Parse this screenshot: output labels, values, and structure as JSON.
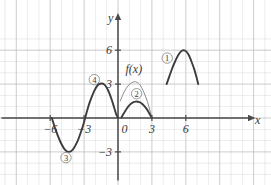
{
  "figure": {
    "kind": "math-graph",
    "width": 271,
    "height": 185,
    "background": "#ffffff"
  },
  "axes": {
    "x_axis_label": "x",
    "y_axis_label": "y",
    "x_ticks": [
      {
        "value": -6,
        "label": "−6"
      },
      {
        "value": -3,
        "label": "−3"
      },
      {
        "value": 0,
        "label": "0"
      },
      {
        "value": 3,
        "label": "3"
      },
      {
        "value": 6,
        "label": "6"
      }
    ],
    "y_ticks": [
      {
        "value": 6,
        "label": "6"
      },
      {
        "value": 3,
        "label": "3"
      },
      {
        "value": -3,
        "label": "−3"
      }
    ],
    "x_range": [
      -8.5,
      11
    ],
    "y_range": [
      -5,
      7
    ],
    "grid": true,
    "grid_color": "#cfcfcf",
    "grid_major_color": "#bdbdbd",
    "axis_color": "#4a4a4a"
  },
  "labels": {
    "function_label": "f(x)",
    "curve_1": "①",
    "curve_2": "②",
    "curve_3": "③",
    "curve_4": "④"
  },
  "colors": {
    "curve_dark": "#3d3d3d",
    "curve_light": "#8a8a8a",
    "text": "#3a3a3a"
  },
  "chart_data": {
    "type": "line",
    "title": "",
    "xlabel": "x",
    "ylabel": "y",
    "xlim": [
      -8.5,
      11
    ],
    "ylim": [
      -5,
      7
    ],
    "grid": true,
    "legend": "none",
    "series": [
      {
        "name": "③ / ④ sine-like wave (left, bold)",
        "style": "bold-dark",
        "annotation_above": "④",
        "annotation_below": "③",
        "points": [
          [
            -5.85,
            0.0
          ],
          [
            -5.5,
            -1.1
          ],
          [
            -5.1,
            -2.1
          ],
          [
            -4.7,
            -2.8
          ],
          [
            -4.35,
            -3.0
          ],
          [
            -4.0,
            -2.8
          ],
          [
            -3.6,
            -2.1
          ],
          [
            -3.2,
            -1.0
          ],
          [
            -3.0,
            -0.35
          ],
          [
            -2.8,
            0.4
          ],
          [
            -2.5,
            1.4
          ],
          [
            -2.1,
            2.4
          ],
          [
            -1.8,
            2.9
          ],
          [
            -1.5,
            3.05
          ],
          [
            -1.2,
            2.95
          ],
          [
            -0.9,
            2.5
          ],
          [
            -0.6,
            1.75
          ],
          [
            -0.35,
            0.95
          ],
          [
            -0.15,
            0.3
          ],
          [
            0.0,
            0.05
          ]
        ]
      },
      {
        "name": "f(x) parabola-like arch (thin gray)",
        "style": "thin-gray",
        "annotation": "f(x)",
        "points": [
          [
            0.2,
            1.5
          ],
          [
            0.4,
            2.0
          ],
          [
            0.6,
            2.4
          ],
          [
            0.85,
            2.8
          ],
          [
            1.1,
            3.05
          ],
          [
            1.4,
            3.2
          ],
          [
            1.7,
            3.15
          ],
          [
            2.0,
            2.85
          ],
          [
            2.3,
            2.25
          ],
          [
            2.6,
            1.45
          ],
          [
            2.85,
            0.6
          ],
          [
            3.0,
            0.0
          ]
        ]
      },
      {
        "name": "② flattened arch (bold dark)",
        "style": "bold-dark",
        "annotation": "②",
        "points": [
          [
            0.3,
            0.05
          ],
          [
            0.6,
            0.55
          ],
          [
            0.9,
            1.0
          ],
          [
            1.2,
            1.3
          ],
          [
            1.55,
            1.45
          ],
          [
            1.9,
            1.4
          ],
          [
            2.2,
            1.2
          ],
          [
            2.5,
            0.85
          ],
          [
            2.75,
            0.45
          ],
          [
            3.0,
            0.0
          ]
        ]
      },
      {
        "name": "① raised shifted arch (bold dark, right)",
        "style": "bold-dark",
        "annotation": "①",
        "points": [
          [
            4.3,
            3.0
          ],
          [
            4.55,
            3.7
          ],
          [
            4.8,
            4.4
          ],
          [
            5.05,
            5.0
          ],
          [
            5.35,
            5.6
          ],
          [
            5.65,
            5.95
          ],
          [
            5.95,
            5.95
          ],
          [
            6.25,
            5.6
          ],
          [
            6.5,
            5.0
          ],
          [
            6.75,
            4.3
          ],
          [
            6.95,
            3.6
          ],
          [
            7.1,
            3.0
          ]
        ]
      }
    ],
    "annotations": [
      {
        "text": "f(x)",
        "x": 1.4,
        "y": 3.95
      },
      {
        "text": "①",
        "x": 4.35,
        "y": 5.3
      },
      {
        "text": "②",
        "x": 1.65,
        "y": 2.15
      },
      {
        "text": "③",
        "x": -4.6,
        "y": -3.5
      },
      {
        "text": "④",
        "x": -2.1,
        "y": 3.4
      }
    ]
  }
}
